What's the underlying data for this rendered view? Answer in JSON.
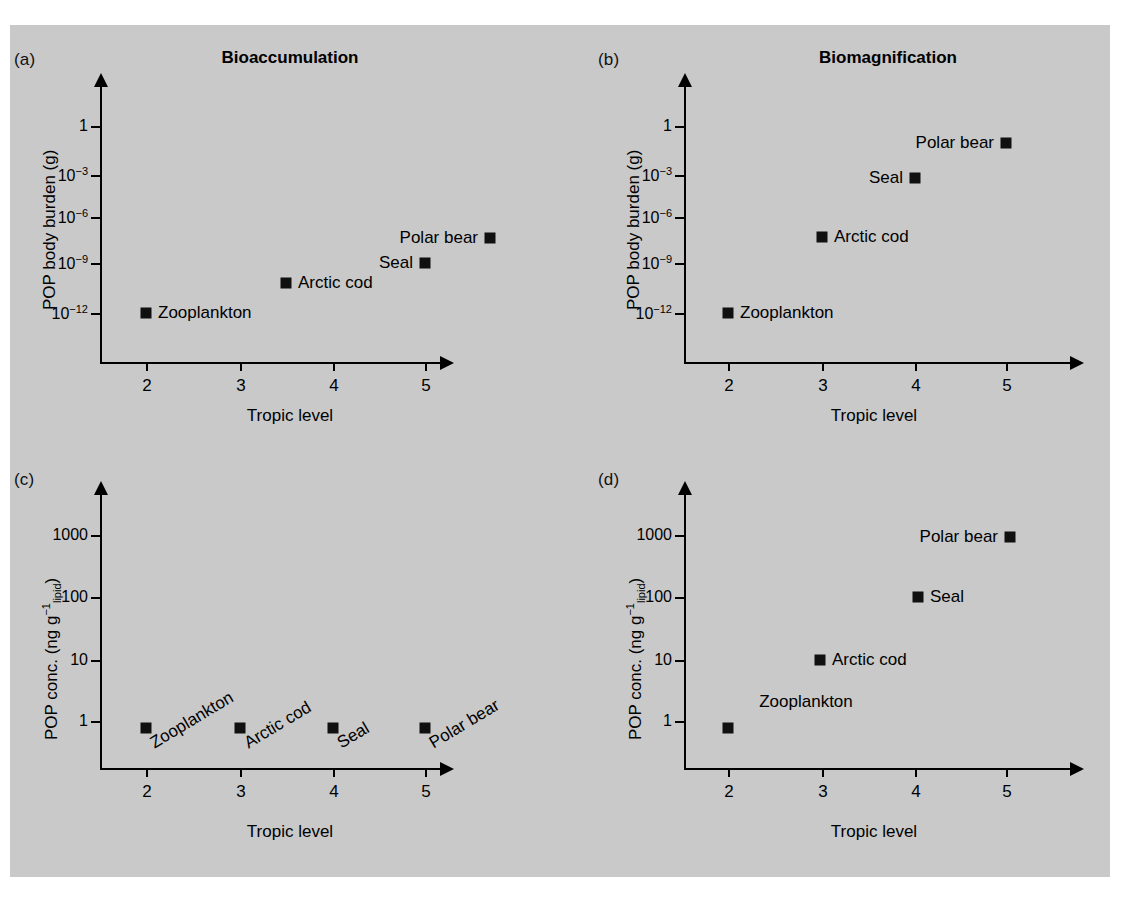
{
  "figure": {
    "background_color": "#c9c9c9",
    "marker_color": "#101010",
    "page_background": "#ffffff"
  },
  "panels": [
    {
      "key": "a",
      "label": "(a)",
      "title": "Bioaccumulation",
      "xlabel": "Tropic level",
      "ylabel_html": "POP body burden (g)",
      "yticks": [
        "1",
        "10<sup>−3</sup>",
        "10<sup>−6</sup>",
        "10<sup>−9</sup>",
        "10<sup>−12</sup>"
      ],
      "xticks": [
        "2",
        "3",
        "4",
        "5"
      ],
      "points": [
        {
          "name": "Zooplankton",
          "label": "Zooplankton",
          "label_pos": "right"
        },
        {
          "name": "Arctic cod",
          "label": "Arctic cod",
          "label_pos": "right"
        },
        {
          "name": "Seal",
          "label": "Seal",
          "label_pos": "left"
        },
        {
          "name": "Polar bear",
          "label": "Polar bear",
          "label_pos": "left"
        }
      ]
    },
    {
      "key": "b",
      "label": "(b)",
      "title": "Biomagnification",
      "xlabel": "Tropic level",
      "ylabel_html": "POP body burden (g)",
      "yticks": [
        "1",
        "10<sup>−3</sup>",
        "10<sup>−6</sup>",
        "10<sup>−9</sup>",
        "10<sup>−12</sup>"
      ],
      "xticks": [
        "2",
        "3",
        "4",
        "5"
      ],
      "points": [
        {
          "name": "Zooplankton",
          "label": "Zooplankton",
          "label_pos": "right"
        },
        {
          "name": "Arctic cod",
          "label": "Arctic cod",
          "label_pos": "right"
        },
        {
          "name": "Seal",
          "label": "Seal",
          "label_pos": "left"
        },
        {
          "name": "Polar bear",
          "label": "Polar bear",
          "label_pos": "left"
        }
      ]
    },
    {
      "key": "c",
      "label": "(c)",
      "title": "",
      "xlabel": "Tropic level",
      "ylabel_html": "POP conc. (ng g<span class=\"sup\">−1</span><span class=\"sub\">lipid</span>)",
      "yticks": [
        "1000",
        "100",
        "10",
        "1"
      ],
      "xticks": [
        "2",
        "3",
        "4",
        "5"
      ],
      "points": [
        {
          "name": "Zooplankton",
          "label": "Zooplankton",
          "label_pos": "rotated"
        },
        {
          "name": "Arctic cod",
          "label": "Arctic cod",
          "label_pos": "rotated"
        },
        {
          "name": "Seal",
          "label": "Seal",
          "label_pos": "rotated"
        },
        {
          "name": "Polar bear",
          "label": "Polar bear",
          "label_pos": "rotated"
        }
      ]
    },
    {
      "key": "d",
      "label": "(d)",
      "title": "",
      "xlabel": "Tropic level",
      "ylabel_html": "POP conc. (ng g<span class=\"sup\">−1</span><span class=\"sub\">lipid</span>)",
      "yticks": [
        "1000",
        "100",
        "10",
        "1"
      ],
      "xticks": [
        "2",
        "3",
        "4",
        "5"
      ],
      "points": [
        {
          "name": "Zooplankton",
          "label": "Zooplankton",
          "label_pos": "above"
        },
        {
          "name": "Arctic cod",
          "label": "Arctic cod",
          "label_pos": "right"
        },
        {
          "name": "Seal",
          "label": "Seal",
          "label_pos": "right"
        },
        {
          "name": "Polar bear",
          "label": "Polar bear",
          "label_pos": "left"
        }
      ]
    }
  ],
  "chart_data": [
    {
      "type": "scatter",
      "panel": "a",
      "title": "Bioaccumulation",
      "xlabel": "Tropic level",
      "ylabel": "POP body burden (g)",
      "yscale": "log",
      "ylim": [
        1e-14,
        30
      ],
      "xlim": [
        1.4,
        5.9
      ],
      "yticks": [
        1,
        0.001,
        1e-06,
        1e-09,
        1e-12
      ],
      "ytick_labels": [
        "1",
        "10^-3",
        "10^-6",
        "10^-9",
        "10^-12"
      ],
      "xticks": [
        2,
        3,
        4,
        5
      ],
      "grid": false,
      "legend": "none",
      "points": [
        {
          "label": "Zooplankton",
          "x": 2.0,
          "y": 1e-12
        },
        {
          "label": "Arctic cod",
          "x": 2.9,
          "y": 1e-10
        },
        {
          "label": "Seal",
          "x": 4.1,
          "y": 3e-09
        },
        {
          "label": "Polar bear",
          "x": 5.0,
          "y": 1e-07
        }
      ]
    },
    {
      "type": "scatter",
      "panel": "b",
      "title": "Biomagnification",
      "xlabel": "Tropic level",
      "ylabel": "POP body burden (g)",
      "yscale": "log",
      "ylim": [
        1e-14,
        30
      ],
      "xlim": [
        1.4,
        5.9
      ],
      "yticks": [
        1,
        0.001,
        1e-06,
        1e-09,
        1e-12
      ],
      "ytick_labels": [
        "1",
        "10^-3",
        "10^-6",
        "10^-9",
        "10^-12"
      ],
      "xticks": [
        2,
        3,
        4,
        5
      ],
      "grid": false,
      "legend": "none",
      "points": [
        {
          "label": "Zooplankton",
          "x": 2.0,
          "y": 1e-12
        },
        {
          "label": "Arctic cod",
          "x": 3.0,
          "y": 1e-07
        },
        {
          "label": "Seal",
          "x": 4.0,
          "y": 0.0003
        },
        {
          "label": "Polar bear",
          "x": 5.0,
          "y": 0.1
        }
      ]
    },
    {
      "type": "scatter",
      "panel": "c",
      "title": "",
      "xlabel": "Tropic level",
      "ylabel": "POP conc. (ng g^-1 lipid)",
      "yscale": "log",
      "ylim": [
        0.06,
        30000
      ],
      "xlim": [
        1.4,
        5.9
      ],
      "yticks": [
        1000,
        100,
        10,
        1
      ],
      "ytick_labels": [
        "1000",
        "100",
        "10",
        "1"
      ],
      "xticks": [
        2,
        3,
        4,
        5
      ],
      "grid": false,
      "legend": "none",
      "points": [
        {
          "label": "Zooplankton",
          "x": 2.0,
          "y": 0.85
        },
        {
          "label": "Arctic cod",
          "x": 3.0,
          "y": 0.85
        },
        {
          "label": "Seal",
          "x": 4.0,
          "y": 0.85
        },
        {
          "label": "Polar bear",
          "x": 5.0,
          "y": 0.85
        }
      ]
    },
    {
      "type": "scatter",
      "panel": "d",
      "title": "",
      "xlabel": "Tropic level",
      "ylabel": "POP conc. (ng g^-1 lipid)",
      "yscale": "log",
      "ylim": [
        0.06,
        30000
      ],
      "xlim": [
        1.4,
        5.9
      ],
      "yticks": [
        1000,
        100,
        10,
        1
      ],
      "ytick_labels": [
        "1000",
        "100",
        "10",
        "1"
      ],
      "xticks": [
        2,
        3,
        4,
        5
      ],
      "grid": false,
      "legend": "none",
      "points": [
        {
          "label": "Zooplankton",
          "x": 2.0,
          "y": 0.85
        },
        {
          "label": "Arctic cod",
          "x": 2.9,
          "y": 10
        },
        {
          "label": "Seal",
          "x": 4.1,
          "y": 130
        },
        {
          "label": "Polar bear",
          "x": 5.0,
          "y": 1500
        }
      ]
    }
  ]
}
